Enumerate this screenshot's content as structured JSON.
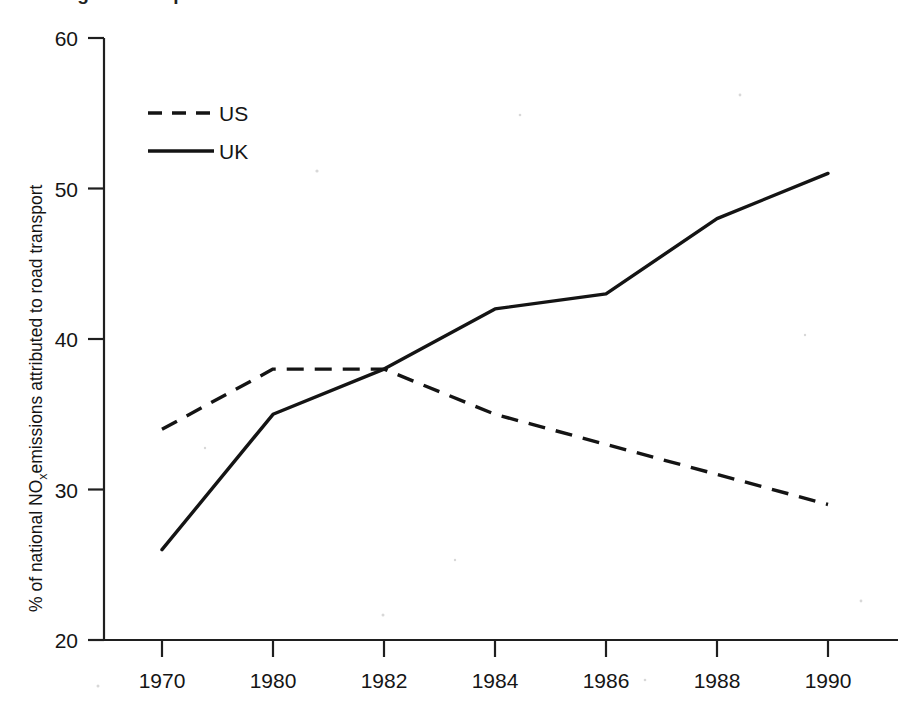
{
  "figure": {
    "background_color": "#ffffff",
    "ink_color": "#141414",
    "title_partial": "Figure 2  Proportion of national emissions of NOx",
    "title_visible": "cut off at top edge"
  },
  "chart_data": {
    "type": "line",
    "title": "",
    "xlabel": "",
    "ylabel": "% of national NOₓ emissions attributed to road transport",
    "ylabel_parts": {
      "before": "% of national NO",
      "subscript": "x",
      "after": "emissions attributed to road transport"
    },
    "categories": [
      "1970",
      "1980",
      "1982",
      "1984",
      "1986",
      "1988",
      "1990"
    ],
    "x": [
      1970,
      1980,
      1982,
      1984,
      1986,
      1988,
      1990
    ],
    "x_spacing": "categorical-even",
    "ylim": [
      20,
      60
    ],
    "yticks": [
      20,
      30,
      40,
      50,
      60
    ],
    "ytick_labels": [
      "20",
      "30",
      "40",
      "50",
      "60"
    ],
    "grid": false,
    "legend_position": "upper-left-inside",
    "series": [
      {
        "name": "US",
        "style": "dashed",
        "color": "#141414",
        "values": [
          34,
          38,
          38,
          35,
          33,
          31,
          29
        ]
      },
      {
        "name": "UK",
        "style": "solid",
        "color": "#141414",
        "values": [
          26,
          35,
          38,
          42,
          43,
          48,
          51
        ]
      }
    ]
  },
  "legend": {
    "entries": [
      {
        "label": "US",
        "style": "dashed"
      },
      {
        "label": "UK",
        "style": "solid"
      }
    ]
  },
  "axes": {
    "y_tick_labels": [
      "60",
      "50",
      "40",
      "30",
      "20"
    ],
    "x_tick_labels": [
      "1970",
      "1980",
      "1982",
      "1984",
      "1986",
      "1988",
      "1990"
    ]
  }
}
